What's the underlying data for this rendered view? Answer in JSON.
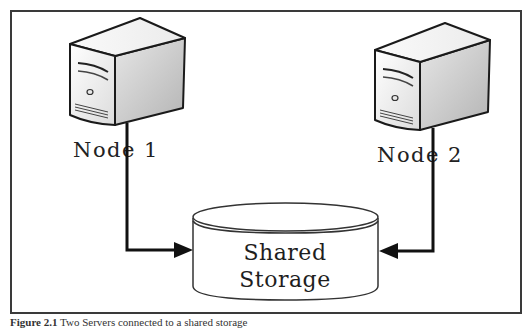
{
  "diagram": {
    "title": "Two servers connected to a shared storage",
    "nodes": [
      {
        "id": "node1",
        "label": "Node 1",
        "icon": "server-tower-icon"
      },
      {
        "id": "node2",
        "label": "Node 2",
        "icon": "server-tower-icon"
      }
    ],
    "storage": {
      "icon": "database-cylinder-icon",
      "line1": "Shared",
      "line2": "Storage"
    },
    "connections": [
      {
        "from": "node1",
        "to": "storage",
        "style": "elbow-arrow"
      },
      {
        "from": "node2",
        "to": "storage",
        "style": "elbow-arrow"
      }
    ],
    "colors": {
      "frame": "#3a3a3a",
      "line": "#111111",
      "server_front": "#f0f0f0",
      "server_side": "#c8c8c8",
      "server_top": "#f7f7f7",
      "storage_fill": "#ffffff"
    }
  },
  "caption": {
    "figure_number": "Figure 2.1",
    "text": "Two Servers connected to a shared storage"
  }
}
